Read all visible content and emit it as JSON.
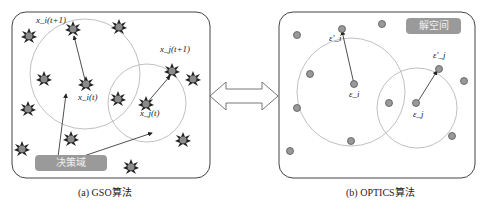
{
  "left_panel": {
    "caption": "(a) GSO算法",
    "badge": "决策域",
    "labels": {
      "xi_t1": "x_i(t+1)",
      "xi_t": "x_i(t)",
      "xj_t1": "x_j(t+1)",
      "xj_t": "x_j(t)"
    }
  },
  "right_panel": {
    "caption": "(b) OPTICS算法",
    "badge": "解空间",
    "labels": {
      "ei_prime": "ε'_i",
      "ei": "ε_i",
      "ej_prime": "ε'_j",
      "ej": "ε_j"
    }
  },
  "connector": {
    "icon": "double-arrow-icon"
  },
  "colors": {
    "agent_fill": "#888888",
    "agent_star": "#222222",
    "circle_stroke": "#b0b0b0",
    "badge_fill": "#9a9a9a",
    "border": "#444444"
  }
}
